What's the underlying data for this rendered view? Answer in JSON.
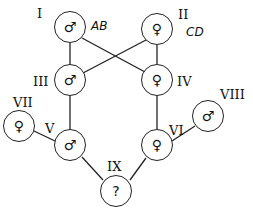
{
  "diagram": {
    "type": "pedigree",
    "individuals": [
      {
        "id": "I",
        "symbol": "♂",
        "sex": "male",
        "genotype": "AB"
      },
      {
        "id": "II",
        "symbol": "♀",
        "sex": "female",
        "genotype": "CD"
      },
      {
        "id": "III",
        "symbol": "♂",
        "sex": "male"
      },
      {
        "id": "IV",
        "symbol": "♀",
        "sex": "female"
      },
      {
        "id": "V",
        "symbol": "♂",
        "sex": "male"
      },
      {
        "id": "VI",
        "symbol": "♀",
        "sex": "female"
      },
      {
        "id": "VII",
        "symbol": "♀",
        "sex": "female"
      },
      {
        "id": "VIII",
        "symbol": "♂",
        "sex": "male"
      },
      {
        "id": "IX",
        "symbol": "?",
        "sex": "unknown"
      }
    ],
    "edges": [
      [
        "I",
        "III"
      ],
      [
        "I",
        "IV"
      ],
      [
        "II",
        "III"
      ],
      [
        "II",
        "IV"
      ],
      [
        "III",
        "V"
      ],
      [
        "IV",
        "VI"
      ],
      [
        "VII",
        "V"
      ],
      [
        "VIII",
        "VI"
      ],
      [
        "V",
        "IX"
      ],
      [
        "VI",
        "IX"
      ]
    ]
  }
}
